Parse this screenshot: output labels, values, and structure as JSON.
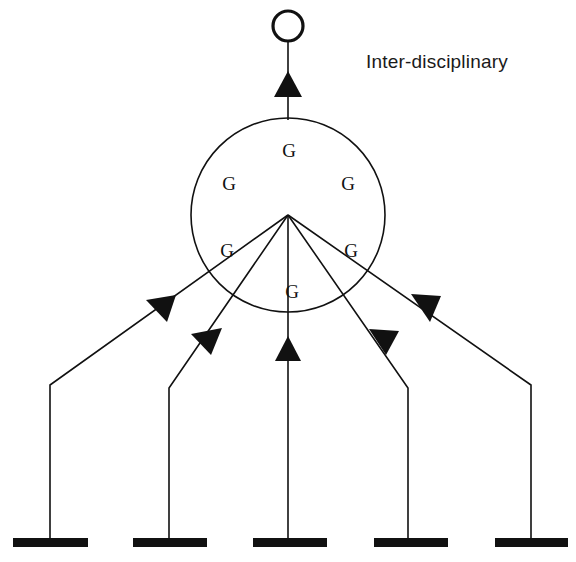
{
  "diagram": {
    "caption": {
      "text": "Inter-disciplinary",
      "x": 366,
      "y": 68
    },
    "output_node": {
      "name": "output-circle",
      "cx": 288,
      "cy": 26,
      "r": 15
    },
    "output_arrow": {
      "name": "output-arrow",
      "direction": "up",
      "line_x": 288,
      "line_top": 41,
      "line_bottom": 120,
      "head_points": "288,71 302,97 274,97"
    },
    "core_circle": {
      "name": "core-circle",
      "cx": 288,
      "cy": 215,
      "r": 97
    },
    "hub": {
      "name": "hub-point",
      "x": 288,
      "y": 215
    },
    "g_nodes": [
      {
        "label": "G",
        "x": 289,
        "y": 157,
        "position": "top-center"
      },
      {
        "label": "G",
        "x": 229,
        "y": 190,
        "position": "upper-left"
      },
      {
        "label": "G",
        "x": 348,
        "y": 190,
        "position": "upper-right"
      },
      {
        "label": "G",
        "x": 227,
        "y": 257,
        "position": "mid-left"
      },
      {
        "label": "G",
        "x": 351,
        "y": 257,
        "position": "mid-right"
      },
      {
        "label": "G",
        "x": 292,
        "y": 298,
        "position": "bottom-center"
      }
    ],
    "branches": [
      {
        "name": "branch-outer-left",
        "bar_index": 0,
        "path": "M 50,545 L 50,385 L 288,215",
        "arrow_points": "176,295 146,300 167,322",
        "arrow_direction": "up-right"
      },
      {
        "name": "branch-inner-left",
        "bar_index": 1,
        "path": "M 169,545 L 169,388 L 288,215",
        "arrow_points": "222,328 191,334 211,355",
        "arrow_direction": "up-right"
      },
      {
        "name": "branch-center",
        "bar_index": 2,
        "path": "M 288,545 L 288,215",
        "arrow_points": "288,336 301,361 275,361",
        "arrow_direction": "up"
      },
      {
        "name": "branch-inner-right",
        "bar_index": 3,
        "path": "M 408,545 L 408,388 L 288,215",
        "arrow_points": "369,329 386,355 399,331",
        "arrow_direction": "up-left"
      },
      {
        "name": "branch-outer-right",
        "bar_index": 4,
        "path": "M 531,545 L 531,385 L 288,215",
        "arrow_points": "411,294 430,322 441,296",
        "arrow_direction": "up-left"
      }
    ],
    "ground_bars": [
      {
        "name": "ground-bar-1",
        "x": 13,
        "y": 538,
        "width": 75,
        "height": 9
      },
      {
        "name": "ground-bar-2",
        "x": 133,
        "y": 538,
        "width": 74,
        "height": 9
      },
      {
        "name": "ground-bar-3",
        "x": 253,
        "y": 538,
        "width": 74,
        "height": 9
      },
      {
        "name": "ground-bar-4",
        "x": 374,
        "y": 538,
        "width": 74,
        "height": 9
      },
      {
        "name": "ground-bar-5",
        "x": 495,
        "y": 538,
        "width": 73,
        "height": 9
      }
    ],
    "colors": {
      "ink": "#111111",
      "background": "#ffffff",
      "caption": "#1a1a1a"
    }
  }
}
